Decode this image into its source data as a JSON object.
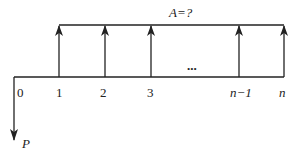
{
  "diagram": {
    "type": "cash-flow-diagram",
    "annuity_label": "A=?",
    "present_value_label": "P",
    "ellipsis": "...",
    "periods": [
      {
        "label": "0",
        "x": 14
      },
      {
        "label": "1",
        "x": 59
      },
      {
        "label": "2",
        "x": 105
      },
      {
        "label": "3",
        "x": 151
      },
      {
        "label": "n−1",
        "x": 239
      },
      {
        "label": "n",
        "x": 284
      }
    ],
    "line_color": "#222222"
  }
}
